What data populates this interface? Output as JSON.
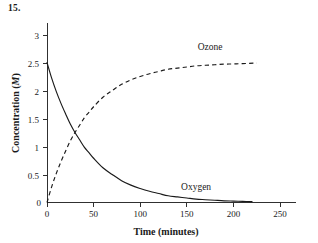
{
  "figure": {
    "problem_number": "15.",
    "background_color": "#ffffff",
    "ink_color": "#1a1a1a"
  },
  "chart_data": {
    "type": "line",
    "title": "",
    "xlabel_prefix": "Time (minutes",
    "xlabel": "Time (minutes)",
    "ylabel_prefix": "Concentration (",
    "ylabel_italic": "M",
    "ylabel_suffix": ")",
    "ylabel": "Concentration (M)",
    "xlim": [
      0,
      265
    ],
    "ylim": [
      0,
      3.15
    ],
    "xticks": [
      0,
      50,
      100,
      150,
      200,
      250
    ],
    "xtick_labels": [
      "0",
      "50",
      "100",
      "150",
      "200",
      "250"
    ],
    "yticks": [
      0,
      0.5,
      1,
      1.5,
      2,
      2.5,
      3
    ],
    "ytick_labels": [
      "0",
      "0.5",
      "1",
      "1.5",
      "2",
      "2.5",
      "3"
    ],
    "grid": false,
    "legend_position": "inline-annotations",
    "annotations": [
      {
        "name": "ozone-label",
        "text": "Ozone",
        "x": 175,
        "y": 2.72
      },
      {
        "name": "oxygen-label",
        "text": "Oxygen",
        "x": 160,
        "y": 0.22
      }
    ],
    "series": [
      {
        "name": "Oxygen",
        "style": "solid",
        "model": "exponential-decay",
        "y0": 2.5,
        "y_final": 0.0,
        "half_life_minutes": 30,
        "x": [
          0,
          5,
          10,
          15,
          20,
          25,
          30,
          35,
          40,
          45,
          50,
          60,
          70,
          80,
          90,
          100,
          110,
          120,
          130,
          140,
          150,
          160,
          170,
          180,
          190,
          200,
          210,
          220
        ],
        "values": [
          2.5,
          2.22,
          1.98,
          1.77,
          1.58,
          1.4,
          1.25,
          1.12,
          0.99,
          0.89,
          0.79,
          0.62,
          0.5,
          0.39,
          0.31,
          0.25,
          0.2,
          0.16,
          0.12,
          0.1,
          0.08,
          0.06,
          0.05,
          0.04,
          0.03,
          0.025,
          0.02,
          0.015
        ]
      },
      {
        "name": "Ozone",
        "style": "dashed",
        "model": "exponential-rise",
        "y0": 0.0,
        "y_final": 2.5,
        "half_life_minutes": 30,
        "x": [
          0,
          5,
          10,
          15,
          20,
          25,
          30,
          35,
          40,
          45,
          50,
          60,
          70,
          80,
          90,
          100,
          110,
          120,
          130,
          140,
          150,
          160,
          170,
          180,
          190,
          200,
          210,
          225
        ],
        "values": [
          0.0,
          0.28,
          0.52,
          0.73,
          0.92,
          1.1,
          1.25,
          1.38,
          1.51,
          1.61,
          1.71,
          1.88,
          2.0,
          2.11,
          2.19,
          2.25,
          2.3,
          2.34,
          2.38,
          2.4,
          2.42,
          2.44,
          2.45,
          2.46,
          2.47,
          2.475,
          2.48,
          2.49
        ]
      }
    ]
  }
}
